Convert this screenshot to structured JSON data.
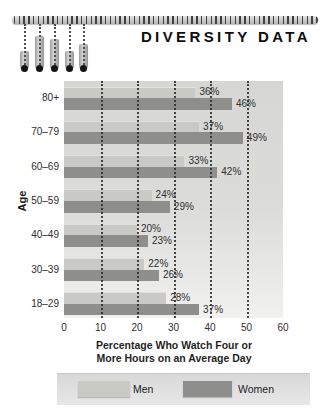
{
  "header": {
    "title": "DIVERSITY DATA"
  },
  "chart_data": {
    "type": "bar",
    "orientation": "horizontal",
    "title": "DIVERSITY DATA",
    "categories": [
      "80+",
      "70–79",
      "60–69",
      "50–59",
      "40–49",
      "30–39",
      "18–29"
    ],
    "series": [
      {
        "name": "Men",
        "color": "#c9c9c5",
        "values": [
          36,
          37,
          33,
          24,
          20,
          22,
          28
        ]
      },
      {
        "name": "Women",
        "color": "#8e8e8c",
        "values": [
          46,
          49,
          42,
          29,
          23,
          26,
          37
        ]
      }
    ],
    "value_suffix": "%",
    "ylabel": "Age",
    "xlabel_lines": [
      "Percentage Who Watch Four or",
      "More Hours on an Average Day"
    ],
    "xlim": [
      0,
      60
    ],
    "xticks": [
      0,
      10,
      20,
      30,
      40,
      50,
      60
    ],
    "gridlines": [
      10,
      20,
      30,
      40,
      50
    ],
    "grid_style": "dotted",
    "legend_position": "bottom",
    "colors": {
      "plot_bg_top": "#d6d6d4",
      "plot_bg_bottom": "#f1f1ef",
      "grid": "#282828",
      "text": "#2e2e2e"
    }
  }
}
